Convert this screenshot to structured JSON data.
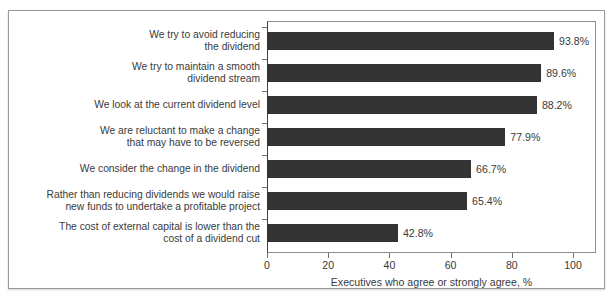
{
  "chart_data": {
    "type": "bar",
    "orientation": "horizontal",
    "title": "",
    "subtitle": "",
    "xlabel": "Executives who agree or strongly agree, %",
    "ylabel": "",
    "xlim": [
      0,
      100
    ],
    "xticks": [
      0,
      20,
      40,
      60,
      80,
      100
    ],
    "xtick_labels": [
      "0",
      "20",
      "40",
      "60",
      "80",
      "100"
    ],
    "grid": false,
    "legend": false,
    "bar_color": "#333333",
    "categories": [
      "We try to avoid reducing\nthe dividend",
      "We try to maintain a smooth\ndividend stream",
      "We look at the current dividend level",
      "We are reluctant to make a change\nthat may have to be reversed",
      "We consider the change in the dividend",
      "Rather than reducing dividends we would raise\nnew funds to undertake a profitable project",
      "The cost of external capital is lower than the\ncost of a dividend cut"
    ],
    "values": [
      93.8,
      89.6,
      88.2,
      77.9,
      66.7,
      65.4,
      42.8
    ],
    "value_labels": [
      "93.8%",
      "89.6%",
      "88.2%",
      "77.9%",
      "66.7%",
      "65.4%",
      "42.8%"
    ]
  }
}
